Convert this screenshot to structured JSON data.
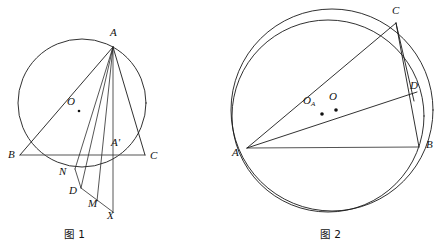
{
  "page": {
    "background": "#ffffff",
    "ink": "#1a1a1a",
    "accent_gray": "#555555",
    "width": 444,
    "height": 246
  },
  "figures": [
    {
      "id": "figure-1",
      "caption": "图 1",
      "description": "Triangle ABC inscribed in a circle with center O, cevians from A meeting points A', N, D, M and external point X",
      "circle": {
        "cx": 82,
        "cy": 103,
        "r": 64
      },
      "points": [
        {
          "name": "A",
          "label": "A",
          "x": 113,
          "y": 47,
          "lx": 110,
          "ly": 27
        },
        {
          "name": "B",
          "label": "B",
          "x": 20,
          "y": 155,
          "lx": 8,
          "ly": 155
        },
        {
          "name": "C",
          "label": "C",
          "x": 145,
          "y": 155,
          "lx": 150,
          "ly": 156
        },
        {
          "name": "O",
          "label": "O",
          "x": 82,
          "y": 111,
          "lx": 69,
          "ly": 99
        },
        {
          "name": "Aprime",
          "label": "A'",
          "x": 119,
          "y": 155,
          "lx": 113,
          "ly": 142
        },
        {
          "name": "N",
          "label": "N",
          "x": 75,
          "y": 169,
          "lx": 60,
          "ly": 172
        },
        {
          "name": "D",
          "label": "D",
          "x": 81,
          "y": 188,
          "lx": 70,
          "ly": 190
        },
        {
          "name": "M",
          "label": "M",
          "x": 97,
          "y": 200,
          "lx": 89,
          "ly": 203
        },
        {
          "name": "X",
          "label": "X",
          "x": 113,
          "y": 212,
          "lx": 108,
          "ly": 214
        }
      ],
      "segments": [
        {
          "from": "A",
          "to": "B"
        },
        {
          "from": "B",
          "to": "C"
        },
        {
          "from": "A",
          "to": "N"
        },
        {
          "from": "A",
          "to": "D"
        },
        {
          "from": "A",
          "to": "M"
        },
        {
          "from": "A",
          "to": "X"
        },
        {
          "from": "A",
          "to": "C"
        },
        {
          "from": "N",
          "to": "D"
        },
        {
          "from": "D",
          "to": "X"
        }
      ]
    },
    {
      "id": "figure-2",
      "caption": "图 2",
      "description": "Triangle ABC inscribed in circle O with a second circle through A and D, centers O_A and O marked",
      "circles": [
        {
          "name": "circumcircle",
          "cx": 332,
          "cy": 110,
          "r": 101
        },
        {
          "name": "second-circle",
          "cx": 328,
          "cy": 116,
          "r": 96
        }
      ],
      "points": [
        {
          "name": "A",
          "label": "A",
          "x": 247,
          "y": 148,
          "lx": 233,
          "ly": 152
        },
        {
          "name": "B",
          "label": "B",
          "x": 419,
          "y": 147,
          "lx": 426,
          "ly": 145
        },
        {
          "name": "C",
          "label": "C",
          "x": 396,
          "y": 23,
          "lx": 393,
          "ly": 6
        },
        {
          "name": "D",
          "label": "D",
          "x": 417,
          "y": 92,
          "lx": 411,
          "ly": 84
        },
        {
          "name": "OA",
          "label": "O",
          "sub": "A",
          "x": 322,
          "y": 114,
          "lx": 302,
          "ly": 98
        },
        {
          "name": "O",
          "label": "O",
          "x": 336,
          "y": 110,
          "lx": 327,
          "ly": 94
        }
      ],
      "segments": [
        {
          "from": "A",
          "to": "C"
        },
        {
          "from": "A",
          "to": "B"
        },
        {
          "from": "A",
          "to": "D"
        },
        {
          "from": "C",
          "to": "B"
        },
        {
          "from": "C",
          "to": "D"
        }
      ]
    }
  ]
}
